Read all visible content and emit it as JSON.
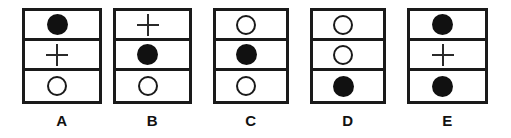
{
  "figure": {
    "type": "symbol-grid-answer-options",
    "background_color": "#ffffff",
    "line_color": "#1a1a1a",
    "fill_color": "#111111",
    "panels": [
      {
        "label": "A",
        "left": 22,
        "width": 80,
        "cells": [
          {
            "symbol": "filled-circle"
          },
          {
            "symbol": "plus"
          },
          {
            "symbol": "open-circle"
          }
        ]
      },
      {
        "label": "B",
        "left": 113,
        "width": 79,
        "cells": [
          {
            "symbol": "plus"
          },
          {
            "symbol": "filled-circle"
          },
          {
            "symbol": "open-circle"
          }
        ]
      },
      {
        "label": "C",
        "left": 213,
        "width": 76,
        "cells": [
          {
            "symbol": "open-circle"
          },
          {
            "symbol": "filled-circle"
          },
          {
            "symbol": "open-circle"
          }
        ]
      },
      {
        "label": "D",
        "left": 310,
        "width": 76,
        "cells": [
          {
            "symbol": "open-circle"
          },
          {
            "symbol": "open-circle"
          },
          {
            "symbol": "filled-circle"
          }
        ]
      },
      {
        "label": "E",
        "left": 407,
        "width": 81,
        "cells": [
          {
            "symbol": "filled-circle"
          },
          {
            "symbol": "plus"
          },
          {
            "symbol": "filled-circle"
          }
        ]
      }
    ]
  }
}
